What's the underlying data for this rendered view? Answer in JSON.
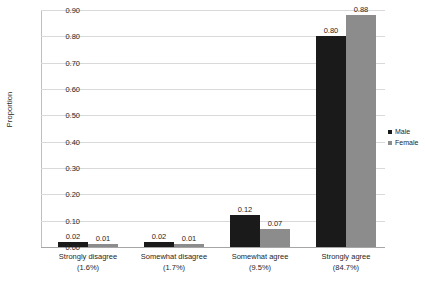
{
  "chart_data": {
    "type": "bar",
    "title": "",
    "xlabel": "",
    "ylabel": "Proportion",
    "ylim": [
      0.0,
      0.9
    ],
    "ytick_values": [
      0.0,
      0.1,
      0.2,
      0.3,
      0.4,
      0.5,
      0.6,
      0.7,
      0.8,
      0.9
    ],
    "ytick_labels": [
      "0.00",
      "0.10",
      "0.20",
      "0.30",
      "0.40",
      "0.50",
      "0.60",
      "0.70",
      "0.80",
      "0.90"
    ],
    "grid": true,
    "grid_axis": "y",
    "legend_position": "right",
    "categories": [
      "Strongly disagree",
      "Somewhat disagree",
      "Somewhat agree",
      "Strongly agree"
    ],
    "category_percents": [
      "(1.6%)",
      "(1.7%)",
      "(9.5%)",
      "(84.7%)"
    ],
    "series": [
      {
        "name": "Male",
        "color": "#1a1a1a",
        "values": [
          0.02,
          0.02,
          0.12,
          0.8
        ],
        "value_labels": [
          "0.02",
          "0.02",
          "0.12",
          "0.80"
        ]
      },
      {
        "name": "Female",
        "color": "#8c8c8c",
        "values": [
          0.01,
          0.01,
          0.07,
          0.88
        ],
        "value_labels": [
          "0.01",
          "0.01",
          "0.07",
          "0.88"
        ]
      }
    ]
  }
}
